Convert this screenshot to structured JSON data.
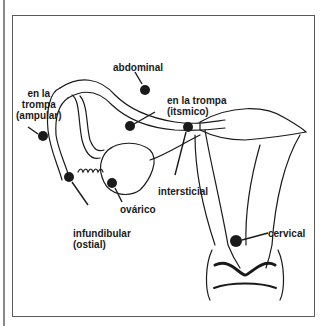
{
  "diagram": {
    "type": "anatomical-illustration",
    "colors": {
      "ink": "#1a1a1a",
      "frame": "#5a5a5a",
      "background": "#ffffff"
    },
    "labels": {
      "abdominal": "abdominal",
      "ampular": "en la\ntrompa\n(ampular)",
      "itsmico": "en la trompa\n(itsmico)",
      "intersticial": "intersticial",
      "infundibular": "infundibular\n(ostial)",
      "ovarico": "ovárico",
      "cervical": "cervical"
    }
  }
}
